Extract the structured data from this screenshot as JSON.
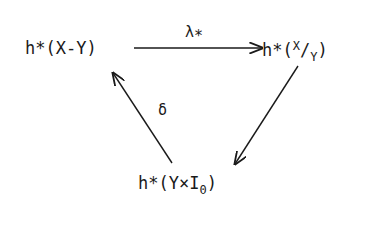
{
  "diagram": {
    "type": "exact-triangle",
    "nodes": {
      "top_left": {
        "prefix": "h*(X-Y)"
      },
      "top_right": {
        "prefix": "h*(",
        "num": "X",
        "slash": "/",
        "den": "Y",
        "suffix": ")"
      },
      "bottom": {
        "prefix": "h*(Y×I",
        "sub": "0",
        "suffix": ")"
      }
    },
    "edges": [
      {
        "from": "top_left",
        "to": "top_right",
        "label": "λ",
        "label_sub": "*"
      },
      {
        "from": "top_right",
        "to": "bottom",
        "label": ""
      },
      {
        "from": "bottom",
        "to": "top_left",
        "label": "δ"
      }
    ]
  }
}
